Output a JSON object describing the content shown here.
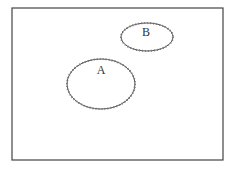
{
  "diagram": {
    "type": "venn",
    "universe": {
      "label": "",
      "x": 12,
      "y": 8,
      "width": 211,
      "height": 152
    },
    "sets": [
      {
        "label": "A",
        "cx": 101,
        "cy": 84,
        "rx": 34,
        "ry": 25,
        "label_x": 101,
        "label_y": 74
      },
      {
        "label": "B",
        "cx": 147,
        "cy": 37,
        "rx": 26,
        "ry": 14,
        "label_x": 146,
        "label_y": 36
      }
    ],
    "colors": {
      "stroke": "#444444",
      "dots": "#777777",
      "background": "#ffffff"
    }
  }
}
